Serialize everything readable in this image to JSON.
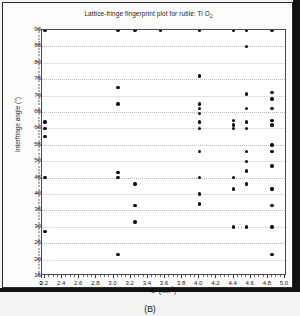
{
  "figure": {
    "panel_label": "(B)",
    "background_color": "#f2f2f0"
  },
  "chart_data": {
    "type": "scatter",
    "title": "Lattice-fringe fingerprint plot for rutile: Ti O",
    "title_subscript": "2",
    "xlabel": "d* (nm",
    "xlabel_sup": "-1",
    "xlabel_tail": ")",
    "xlabel_full": "d* (nm-1)",
    "ylabel": "Interfringe angle (°)",
    "xlim": [
      0,
      5.0
    ],
    "ylim": [
      15,
      90
    ],
    "x_break_after_zero": true,
    "xticks": [
      0,
      2.2,
      2.4,
      2.6,
      2.8,
      3.0,
      3.2,
      3.4,
      3.6,
      3.8,
      4.0,
      4.2,
      4.4,
      4.6,
      4.8,
      5.0
    ],
    "xtick_labels": [
      "0",
      "2.2",
      "2.4",
      "2.6",
      "2.8",
      "3.0",
      "3.2",
      "3.4",
      "3.6",
      "3.8",
      "4.0",
      "4.2",
      "4.4",
      "4.6",
      "4.8",
      "5.0"
    ],
    "yticks": [
      15,
      20,
      25,
      30,
      35,
      40,
      45,
      50,
      55,
      60,
      65,
      70,
      75,
      80,
      85,
      90
    ],
    "ytick_labels": [
      "15",
      "20",
      "25",
      "30",
      "35",
      "40",
      "45",
      "50",
      "55",
      "60",
      "65",
      "70",
      "75",
      "80",
      "85",
      "90"
    ],
    "grid": true,
    "grid_style": "dotted",
    "legend": null,
    "marker": "filled-circle",
    "marker_color": "#0d0d0d",
    "points": [
      {
        "x": 2.2,
        "y": 90
      },
      {
        "x": 2.2,
        "y": 62
      },
      {
        "x": 2.2,
        "y": 60
      },
      {
        "x": 2.2,
        "y": 57.5
      },
      {
        "x": 2.2,
        "y": 45
      },
      {
        "x": 2.2,
        "y": 28.5
      },
      {
        "x": 3.05,
        "y": 90
      },
      {
        "x": 3.05,
        "y": 72.5
      },
      {
        "x": 3.05,
        "y": 67.5
      },
      {
        "x": 3.05,
        "y": 46.5
      },
      {
        "x": 3.05,
        "y": 45
      },
      {
        "x": 3.05,
        "y": 21.5
      },
      {
        "x": 3.25,
        "y": 90
      },
      {
        "x": 3.25,
        "y": 43
      },
      {
        "x": 3.25,
        "y": 36.5
      },
      {
        "x": 3.25,
        "y": 31.5
      },
      {
        "x": 3.55,
        "y": 90
      },
      {
        "x": 4.0,
        "y": 90
      },
      {
        "x": 4.0,
        "y": 76
      },
      {
        "x": 4.0,
        "y": 67.5
      },
      {
        "x": 4.0,
        "y": 66
      },
      {
        "x": 4.0,
        "y": 64.5
      },
      {
        "x": 4.0,
        "y": 62
      },
      {
        "x": 4.0,
        "y": 60
      },
      {
        "x": 4.0,
        "y": 53
      },
      {
        "x": 4.0,
        "y": 45
      },
      {
        "x": 4.0,
        "y": 40
      },
      {
        "x": 4.0,
        "y": 37
      },
      {
        "x": 4.4,
        "y": 90
      },
      {
        "x": 4.4,
        "y": 62.5
      },
      {
        "x": 4.4,
        "y": 61
      },
      {
        "x": 4.4,
        "y": 60
      },
      {
        "x": 4.4,
        "y": 45
      },
      {
        "x": 4.4,
        "y": 41.5
      },
      {
        "x": 4.4,
        "y": 30
      },
      {
        "x": 4.55,
        "y": 90
      },
      {
        "x": 4.55,
        "y": 85
      },
      {
        "x": 4.55,
        "y": 70.5
      },
      {
        "x": 4.55,
        "y": 66
      },
      {
        "x": 4.55,
        "y": 62
      },
      {
        "x": 4.55,
        "y": 60
      },
      {
        "x": 4.55,
        "y": 53
      },
      {
        "x": 4.55,
        "y": 50
      },
      {
        "x": 4.55,
        "y": 47
      },
      {
        "x": 4.55,
        "y": 43
      },
      {
        "x": 4.55,
        "y": 30
      },
      {
        "x": 4.85,
        "y": 90
      },
      {
        "x": 4.85,
        "y": 71
      },
      {
        "x": 4.85,
        "y": 69
      },
      {
        "x": 4.85,
        "y": 66
      },
      {
        "x": 4.85,
        "y": 62.5
      },
      {
        "x": 4.85,
        "y": 61
      },
      {
        "x": 4.85,
        "y": 55
      },
      {
        "x": 4.85,
        "y": 53
      },
      {
        "x": 4.85,
        "y": 48.5
      },
      {
        "x": 4.85,
        "y": 41.5
      },
      {
        "x": 4.85,
        "y": 36.5
      },
      {
        "x": 4.85,
        "y": 30
      },
      {
        "x": 4.85,
        "y": 21.5
      }
    ]
  }
}
